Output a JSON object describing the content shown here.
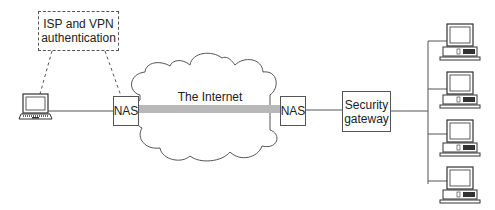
{
  "diagram": {
    "auth_box": {
      "line1": "ISP and VPN",
      "line2": "authentication"
    },
    "cloud": {
      "label": "The Internet"
    },
    "nas_left": {
      "label": "NAS"
    },
    "nas_right": {
      "label": "NAS"
    },
    "gateway": {
      "line1": "Security",
      "line2": "gateway"
    },
    "remote_client": {
      "type": "laptop-icon"
    },
    "lan_hosts": [
      {
        "type": "desktop-computer-icon"
      },
      {
        "type": "desktop-computer-icon"
      },
      {
        "type": "desktop-computer-icon"
      },
      {
        "type": "desktop-computer-icon"
      }
    ],
    "colors": {
      "line": "#555555",
      "tunnel": "#b8b8b8",
      "background": "#ffffff"
    }
  }
}
